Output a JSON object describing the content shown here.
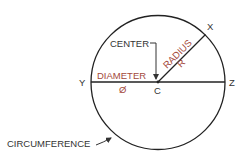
{
  "diagram": {
    "points": {
      "center": "C",
      "x": "X",
      "y": "Y",
      "z": "Z"
    },
    "labels": {
      "center": "CENTER",
      "radius": "RADIUS",
      "radius_symbol": "R",
      "diameter": "DIAMETER",
      "diameter_symbol": "Ø",
      "circumference": "CIRCUMFERENCE"
    },
    "colors": {
      "line": "#222222",
      "label": "#333333",
      "accent": "#a3483a"
    }
  }
}
